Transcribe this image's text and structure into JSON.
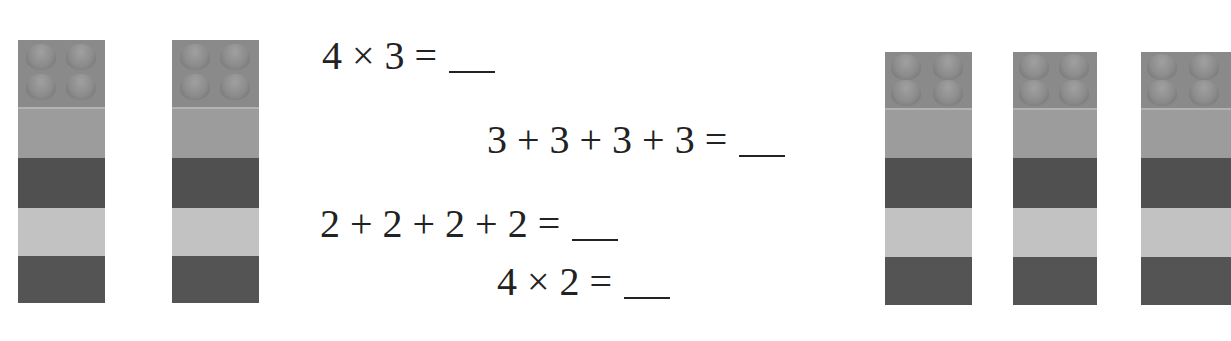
{
  "worksheet": {
    "equations": [
      {
        "text": "4 × 3 =",
        "answer": ""
      },
      {
        "text": "3 + 3 + 3 + 3 =",
        "answer": ""
      },
      {
        "text": "2 + 2 + 2 + 2 =",
        "answer": ""
      },
      {
        "text": "4 × 2 =",
        "answer": ""
      }
    ],
    "left_group": {
      "brick_count": 2,
      "description": "stacks of 4 bricks each"
    },
    "right_group": {
      "brick_count": 3,
      "description": "stacks of 4 bricks each"
    },
    "colors": {
      "stud": "#8a8a8a",
      "mid_gray": "#9c9c9c",
      "dark": "#505050",
      "light": "#c2c2c2"
    }
  }
}
